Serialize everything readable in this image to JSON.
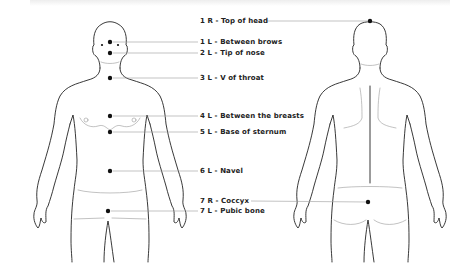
{
  "diagram": {
    "type": "body-points-chart",
    "views": [
      "front",
      "back"
    ],
    "colors": {
      "outline": "#222222",
      "leader": "#9a9a9a",
      "dot": "#111111",
      "text": "#222222"
    },
    "labels": [
      {
        "id": "top-of-head",
        "text": "1 R - Top of head",
        "view": "back",
        "x": 228,
        "y": 17
      },
      {
        "id": "between-brows",
        "text": "1 L - Between brows",
        "view": "front",
        "x": 200,
        "y": 38
      },
      {
        "id": "tip-of-nose",
        "text": "2 L - Tip of nose",
        "view": "front",
        "x": 200,
        "y": 49
      },
      {
        "id": "v-of-throat",
        "text": "3 L - V of throat",
        "view": "front",
        "x": 200,
        "y": 73
      },
      {
        "id": "between-breasts",
        "text": "4 L - Between the breasts",
        "view": "front",
        "x": 200,
        "y": 112
      },
      {
        "id": "base-of-sternum",
        "text": "5 L - Base of sternum",
        "view": "front",
        "x": 200,
        "y": 127
      },
      {
        "id": "navel",
        "text": "6 L - Navel",
        "view": "front",
        "x": 200,
        "y": 166
      },
      {
        "id": "coccyx",
        "text": "7 R - Coccyx",
        "view": "back",
        "x": 200,
        "y": 197
      },
      {
        "id": "pubic-bone",
        "text": "7 L - Pubic bone",
        "view": "front",
        "x": 200,
        "y": 207
      }
    ]
  }
}
